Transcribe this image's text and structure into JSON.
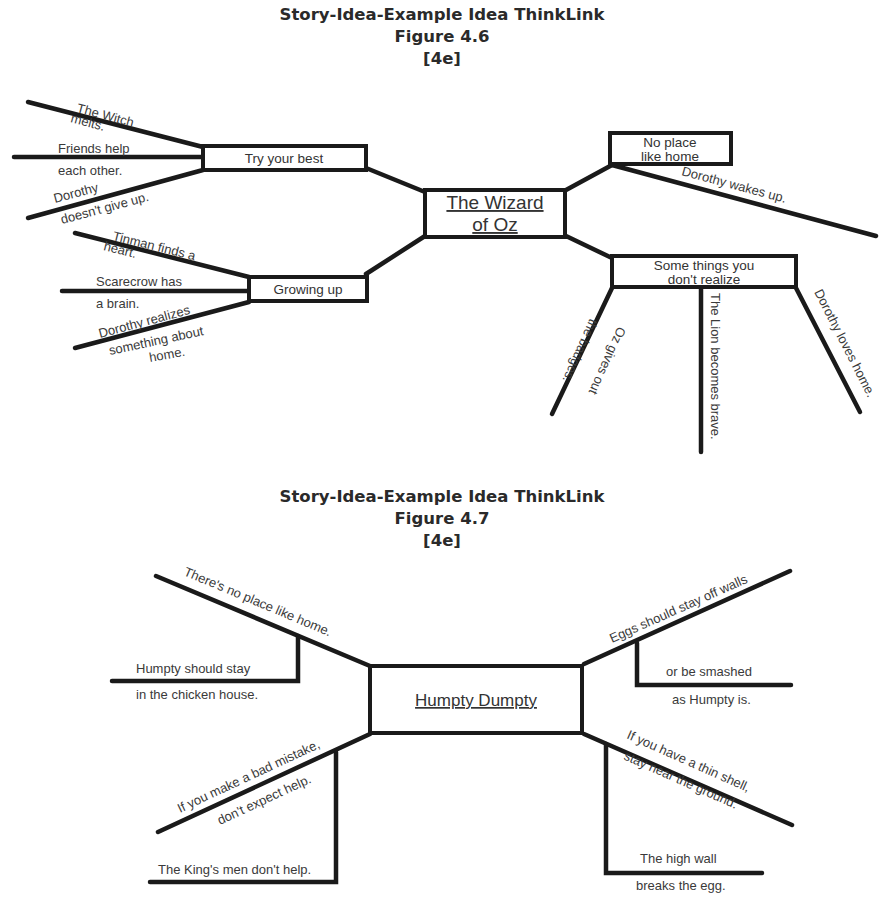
{
  "figure1": {
    "title": "Story-Idea-Example Idea ThinkLink",
    "figure_number": "Figure 4.6",
    "code": "[4e]",
    "center": {
      "line1": "The Wizard",
      "line2": "of Oz"
    },
    "ideas": [
      {
        "label": "Try your best",
        "examples": [
          {
            "line1": "The Witch",
            "line2": "melts."
          },
          {
            "line1": "Friends help",
            "line2": "each other."
          },
          {
            "line1": "Dorothy",
            "line2": "doesn't give up."
          }
        ]
      },
      {
        "label": "Growing up",
        "examples": [
          {
            "line1": "Tinman finds a",
            "line2": "heart."
          },
          {
            "line1": "Scarecrow has",
            "line2": "a brain."
          },
          {
            "line1": "Dorothy realizes",
            "line2": "something about",
            "line3": "home."
          }
        ]
      },
      {
        "label_line1": "No place",
        "label_line2": "like home",
        "examples": [
          {
            "line1": "Dorothy wakes up."
          }
        ]
      },
      {
        "label_line1": "Some things you",
        "label_line2": "don't realize",
        "examples": [
          {
            "line1": "Oz gives out",
            "line2": "the badges."
          },
          {
            "line1": "The Lion becomes brave."
          },
          {
            "line1": "Dorothy loves home."
          }
        ]
      }
    ]
  },
  "figure2": {
    "title": "Story-Idea-Example Idea ThinkLink",
    "figure_number": "Figure 4.7",
    "code": "[4e]",
    "center": "Humpty Dumpty",
    "ideas": [
      {
        "label": "There's no place like home.",
        "example_line1": "Humpty should stay",
        "example_line2": "in the chicken house."
      },
      {
        "label": "Eggs should stay off walls",
        "example_line1": "or be smashed",
        "example_line2": "as Humpty is."
      },
      {
        "label_line1": "If you make a bad mistake,",
        "label_line2": "don't expect help.",
        "example_line1": "The King's men don't help."
      },
      {
        "label_line1": "If you have a thin shell,",
        "label_line2": "stay near the ground.",
        "example_line1": "The high wall",
        "example_line2": "breaks the egg."
      }
    ]
  }
}
